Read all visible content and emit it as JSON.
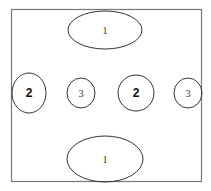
{
  "diagram": {
    "frame": {
      "stroke": "#777777"
    },
    "shapes": [
      {
        "id": "top-ellipse",
        "label": "1",
        "cx": 105,
        "cy": 30,
        "rx": 37,
        "ry": 19,
        "bold": false
      },
      {
        "id": "left-circle-2",
        "label": "2",
        "cx": 29,
        "cy": 93,
        "rx": 17,
        "ry": 20,
        "bold": true
      },
      {
        "id": "left-circle-3",
        "label": "3",
        "cx": 81,
        "cy": 93,
        "rx": 14,
        "ry": 15,
        "bold": false
      },
      {
        "id": "right-circle-2",
        "label": "2",
        "cx": 136,
        "cy": 93,
        "rx": 18,
        "ry": 18,
        "bold": true
      },
      {
        "id": "right-circle-3",
        "label": "3",
        "cx": 188,
        "cy": 93,
        "rx": 14,
        "ry": 15,
        "bold": false
      },
      {
        "id": "bottom-ellipse",
        "label": "1",
        "cx": 105,
        "cy": 159,
        "rx": 38,
        "ry": 23,
        "bold": false
      }
    ]
  }
}
